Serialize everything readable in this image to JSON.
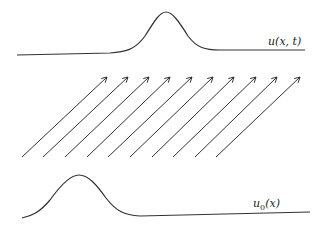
{
  "diagram": {
    "top_curve": {
      "label": "u(x, t)",
      "description": "translated wave profile at time t"
    },
    "bottom_curve": {
      "label": "u0(x)",
      "label_main": "u",
      "label_sub": "0",
      "label_arg": "(x)",
      "description": "initial wave profile"
    },
    "characteristics": {
      "count": 10,
      "description": "parallel characteristic lines with arrowheads pointing up-right",
      "bases_x": [
        22,
        43,
        65,
        87,
        108,
        130,
        152,
        173,
        195,
        216
      ],
      "tips_x": [
        107,
        128,
        149,
        170,
        192,
        213,
        234,
        256,
        277,
        300
      ],
      "base_y": 157,
      "tip_y": 77
    },
    "colors": {
      "line": "#333333",
      "background": "#ffffff"
    }
  }
}
